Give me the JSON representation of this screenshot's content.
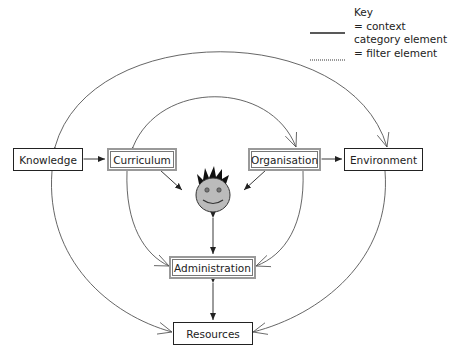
{
  "key": {
    "title": "Key",
    "line1": "= context",
    "line2": "category element",
    "line3": "= filter element"
  },
  "nodes": {
    "knowledge": "Knowledge",
    "curriculum": "Curriculum",
    "organisation": "Organisation",
    "environment": "Environment",
    "administration": "Administration",
    "resources": "Resources"
  },
  "center": {
    "icon": "smiley-face-icon"
  }
}
